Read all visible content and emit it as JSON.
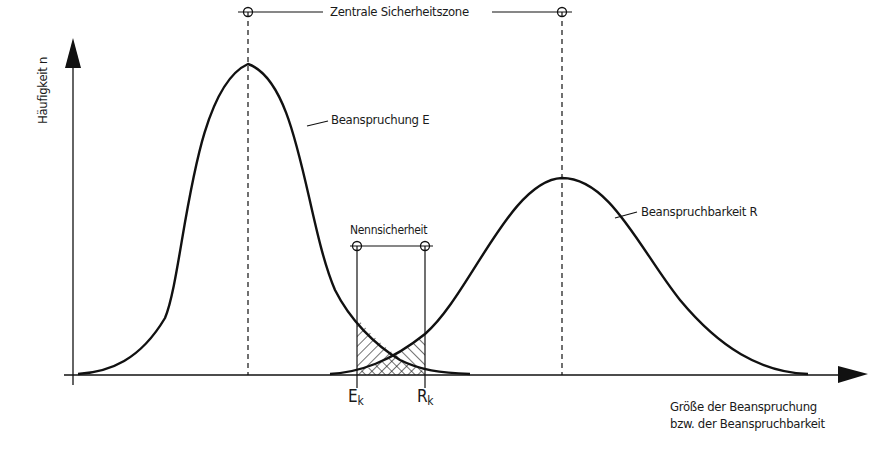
{
  "diagram": {
    "type": "overlapping distribution curves (stress vs. strength)",
    "y_axis": {
      "label": "Häufigkeit n"
    },
    "x_axis": {
      "label_line1": "Größe der Beanspruchung",
      "label_line2": "bzw. der Beanspruchbarkeit"
    },
    "curves": [
      {
        "name": "Beanspruchung E",
        "label": "Beanspruchung E",
        "peak": "higher, narrower, left"
      },
      {
        "name": "Beanspruchbarkeit R",
        "label": "Beanspruchbarkeit R",
        "peak": "lower, wider, right"
      }
    ],
    "dimensions": [
      {
        "label": "Zentrale Sicherheitszone",
        "between": "mean E – mean R"
      },
      {
        "label": "Nennsicherheit",
        "between": "E_k – R_k"
      }
    ],
    "markers": [
      {
        "main": "E",
        "sub": "k"
      },
      {
        "main": "R",
        "sub": "k"
      }
    ],
    "hatched_region": "overlap area between E_k and R_k"
  },
  "colors": {
    "line": "#111111",
    "background": "#ffffff"
  }
}
